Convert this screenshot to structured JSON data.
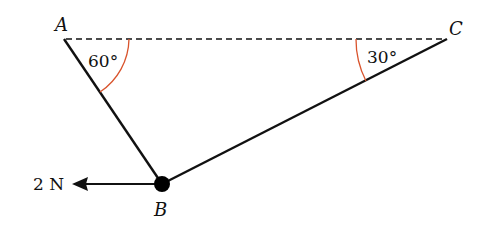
{
  "diagram": {
    "points": {
      "A": {
        "label": "A",
        "x": 64,
        "y": 38
      },
      "B": {
        "label": "B",
        "x": 162,
        "y": 184
      },
      "C": {
        "label": "C",
        "x": 447,
        "y": 39
      }
    },
    "angles": {
      "at_A": {
        "label": "60°",
        "color": "#d9532c"
      },
      "at_C": {
        "label": "30°",
        "color": "#d9532c"
      }
    },
    "force": {
      "label": "2 N",
      "direction": "left"
    },
    "line_color": "#111111"
  }
}
